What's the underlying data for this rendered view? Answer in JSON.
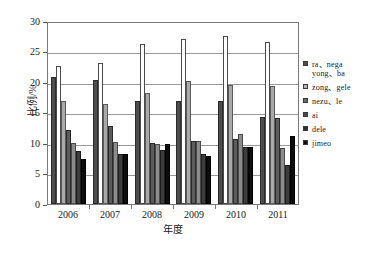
{
  "chart_data": {
    "type": "bar",
    "title": "",
    "xlabel": "年度",
    "ylabel": "比例/%",
    "categories": [
      "2006",
      "2007",
      "2008",
      "2009",
      "2010",
      "2011"
    ],
    "ylim": [
      0,
      30
    ],
    "ytick_labels": [
      "0",
      "5",
      "10",
      "15",
      "20",
      "25",
      "30"
    ],
    "ytick_values": [
      0,
      5,
      10,
      15,
      20,
      25,
      30
    ],
    "grid": true,
    "legend_position": "right",
    "series": [
      {
        "name": "ra、nega yong、ba",
        "color": "#4d4d4d",
        "values": [
          21.1,
          20.5,
          17.0,
          17.0,
          17.0,
          14.5
        ]
      },
      {
        "name": "zong、gele",
        "color": "#ffffff",
        "values": [
          22.9,
          23.4,
          26.5,
          27.3,
          27.8,
          26.8
        ]
      },
      {
        "name": "nezu、le",
        "color": "#a9a9a9",
        "values": [
          17.0,
          16.6,
          18.4,
          20.4,
          19.8,
          19.6
        ]
      },
      {
        "name": "ai",
        "color": "#5c5c5c",
        "values": [
          12.3,
          13.0,
          10.1,
          10.5,
          10.7,
          14.3
        ]
      },
      {
        "name": "dele",
        "color": "#8c8c8c",
        "values": [
          10.1,
          10.2,
          10.0,
          10.4,
          11.6,
          9.3
        ]
      },
      {
        "name": "jimeo",
        "color": "#3d3d3d",
        "values": [
          8.8,
          8.3,
          9.0,
          8.3,
          9.5,
          6.4
        ]
      },
      {
        "name": "jimeo",
        "color": "#0d0d0d",
        "values": [
          7.5,
          8.3,
          9.9,
          7.9,
          9.5,
          11.3
        ]
      }
    ]
  },
  "legend": {
    "entries": [
      {
        "label": "ra、nega\nyong、ba",
        "swatch": "#4d4d4d",
        "two_line": true
      },
      {
        "label": "zong、gele",
        "swatch": "#b5b5b5",
        "two_line": false
      },
      {
        "label": "nezu、le",
        "swatch": "#6a6a6a",
        "two_line": false
      },
      {
        "label": "ai",
        "swatch": "#4a4a4a",
        "two_line": false
      },
      {
        "label": "dele",
        "swatch": "#2e2e2e",
        "two_line": false
      },
      {
        "label": "jimeo",
        "swatch": "#111111",
        "two_line": false
      }
    ]
  }
}
